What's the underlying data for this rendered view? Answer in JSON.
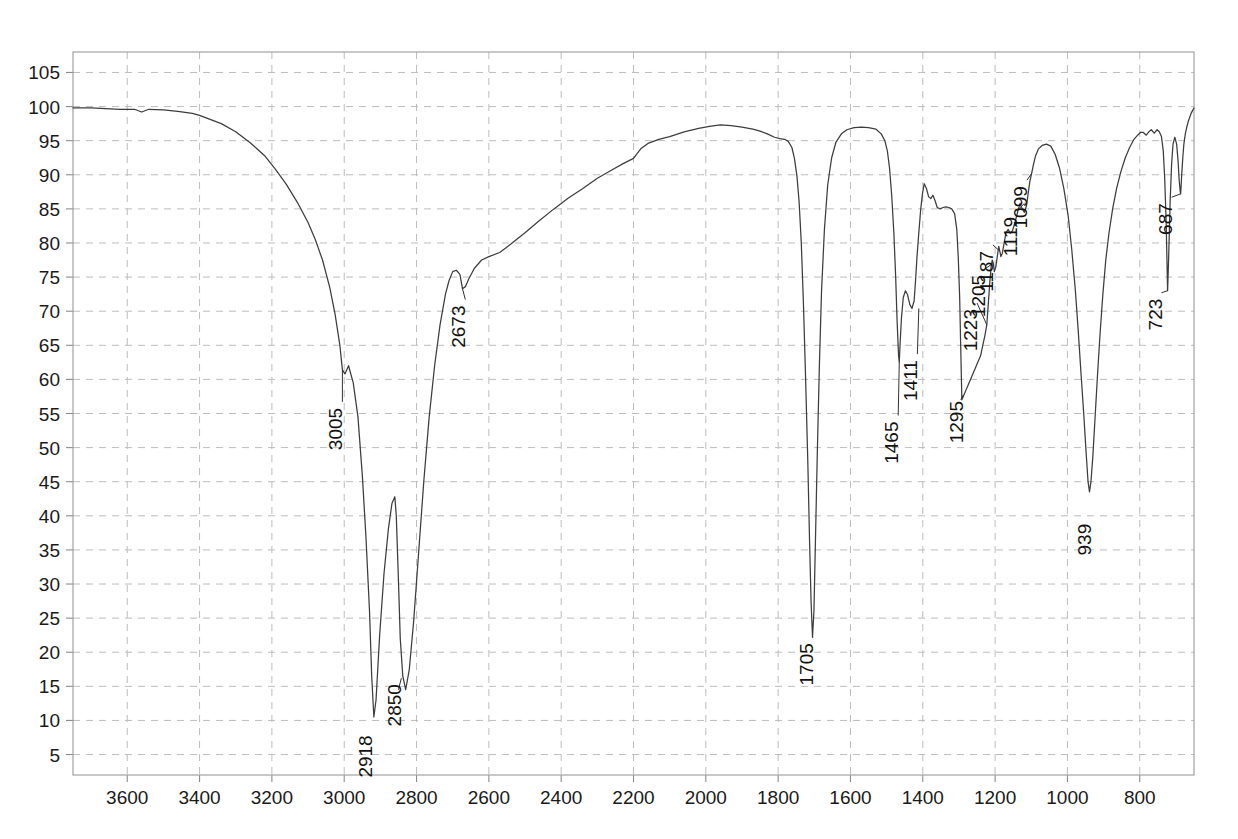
{
  "chart_data": {
    "type": "line",
    "title": "",
    "subtitle": "",
    "xlabel": "",
    "ylabel": "",
    "xlim": [
      3750,
      650
    ],
    "ylim": [
      2,
      108
    ],
    "x_axis_reversed": true,
    "grid": true,
    "legend": "none",
    "x_ticks": [
      3600,
      3400,
      3200,
      3000,
      2800,
      2600,
      2400,
      2200,
      2000,
      1800,
      1600,
      1400,
      1200,
      1000,
      800
    ],
    "y_ticks": [
      5,
      10,
      15,
      20,
      25,
      30,
      35,
      40,
      45,
      50,
      55,
      60,
      65,
      70,
      75,
      80,
      85,
      90,
      95,
      100,
      105
    ],
    "series": [
      {
        "name": "transmittance",
        "color": "#3d3d3d",
        "x": [
          3750,
          3730,
          3700,
          3660,
          3620,
          3580,
          3560,
          3540,
          3500,
          3460,
          3420,
          3400,
          3380,
          3340,
          3300,
          3260,
          3220,
          3190,
          3160,
          3130,
          3100,
          3080,
          3060,
          3040,
          3025,
          3012,
          3005,
          2998,
          2988,
          2975,
          2962,
          2950,
          2940,
          2930,
          2924,
          2918,
          2912,
          2902,
          2890,
          2878,
          2868,
          2860,
          2856,
          2850,
          2845,
          2838,
          2830,
          2820,
          2808,
          2795,
          2780,
          2765,
          2750,
          2735,
          2720,
          2710,
          2700,
          2690,
          2680,
          2673,
          2665,
          2655,
          2640,
          2620,
          2600,
          2570,
          2540,
          2500,
          2460,
          2420,
          2380,
          2340,
          2300,
          2260,
          2230,
          2200,
          2180,
          2160,
          2130,
          2100,
          2060,
          2020,
          1990,
          1960,
          1930,
          1900,
          1870,
          1850,
          1830,
          1810,
          1795,
          1782,
          1772,
          1762,
          1755,
          1748,
          1742,
          1736,
          1730,
          1724,
          1718,
          1713,
          1709,
          1705,
          1701,
          1697,
          1692,
          1686,
          1680,
          1672,
          1663,
          1652,
          1640,
          1625,
          1610,
          1590,
          1570,
          1550,
          1530,
          1515,
          1505,
          1498,
          1492,
          1486,
          1480,
          1475,
          1471,
          1467,
          1465,
          1463,
          1459,
          1454,
          1448,
          1442,
          1436,
          1430,
          1424,
          1420,
          1416,
          1411,
          1406,
          1401,
          1396,
          1390,
          1384,
          1378,
          1372,
          1366,
          1360,
          1352,
          1344,
          1336,
          1328,
          1320,
          1312,
          1306,
          1302,
          1298,
          1295,
          1292,
          1288,
          1284,
          1280,
          1276,
          1272,
          1268,
          1264,
          1260,
          1256,
          1252,
          1248,
          1244,
          1240,
          1236,
          1232,
          1228,
          1223,
          1219,
          1215,
          1211,
          1208,
          1205,
          1202,
          1198,
          1194,
          1190,
          1187,
          1184,
          1180,
          1175,
          1170,
          1164,
          1158,
          1152,
          1145,
          1138,
          1131,
          1125,
          1119,
          1113,
          1108,
          1104,
          1099,
          1094,
          1088,
          1080,
          1070,
          1058,
          1046,
          1034,
          1022,
          1010,
          998,
          988,
          978,
          970,
          962,
          955,
          948,
          943,
          939,
          935,
          930,
          924,
          917,
          910,
          902,
          894,
          885,
          875,
          864,
          852,
          840,
          828,
          816,
          806,
          798,
          790,
          782,
          775,
          768,
          760,
          752,
          746,
          740,
          735,
          731,
          727,
          723,
          720,
          716,
          712,
          708,
          703,
          698,
          694,
          691,
          688,
          687,
          686,
          684,
          681,
          678,
          674,
          670,
          666,
          662,
          658,
          654,
          650
        ],
        "y": [
          99.8,
          99.8,
          99.8,
          99.7,
          99.6,
          99.6,
          99.2,
          99.6,
          99.5,
          99.3,
          99.0,
          98.7,
          98.3,
          97.5,
          96.3,
          94.7,
          92.8,
          90.8,
          88.6,
          86.0,
          83.0,
          80.5,
          77.5,
          73.5,
          69.5,
          65.0,
          61.4,
          60.8,
          62.0,
          59.5,
          54.5,
          46.0,
          37.0,
          26.0,
          16.5,
          10.5,
          13.0,
          22.5,
          31.5,
          38.0,
          41.8,
          42.8,
          40.0,
          30.5,
          22.0,
          16.5,
          14.5,
          17.5,
          24.5,
          34.0,
          45.0,
          54.5,
          62.0,
          68.0,
          72.5,
          74.5,
          75.8,
          76.0,
          75.4,
          73.3,
          73.6,
          74.8,
          76.3,
          77.5,
          78.0,
          78.6,
          79.8,
          81.5,
          83.3,
          85.0,
          86.6,
          88.0,
          89.5,
          90.7,
          91.6,
          92.4,
          93.8,
          94.6,
          95.2,
          95.6,
          96.3,
          96.8,
          97.1,
          97.3,
          97.2,
          97.0,
          96.7,
          96.4,
          96.0,
          95.5,
          95.3,
          95.2,
          94.9,
          94.0,
          92.4,
          89.8,
          86.0,
          80.0,
          71.0,
          60.0,
          48.0,
          36.0,
          27.5,
          22.2,
          26.0,
          36.0,
          48.5,
          62.0,
          73.0,
          82.0,
          88.5,
          92.5,
          94.8,
          96.0,
          96.6,
          96.9,
          97.0,
          96.9,
          96.7,
          96.0,
          95.0,
          93.5,
          91.0,
          87.0,
          81.5,
          75.0,
          68.5,
          63.5,
          62.5,
          65.0,
          69.0,
          72.0,
          73.0,
          72.4,
          71.0,
          70.4,
          71.5,
          74.5,
          78.0,
          81.5,
          84.8,
          87.2,
          88.7,
          88.0,
          86.8,
          86.5,
          87.0,
          86.2,
          85.2,
          85.0,
          85.2,
          85.3,
          85.2,
          85.0,
          84.3,
          82.0,
          78.0,
          72.0,
          64.5,
          57.0,
          57.5,
          58.0,
          58.5,
          59.0,
          59.5,
          60.0,
          60.5,
          61.0,
          61.5,
          62.0,
          62.5,
          63.0,
          63.5,
          64.5,
          65.5,
          66.5,
          68.0,
          71.0,
          74.0,
          76.5,
          77.5,
          77.0,
          75.8,
          76.5,
          78.0,
          79.5,
          78.8,
          78.0,
          78.5,
          80.0,
          81.5,
          82.0,
          81.4,
          81.8,
          83.0,
          84.5,
          85.8,
          85.0,
          84.5,
          85.5,
          87.5,
          89.0,
          90.2,
          91.5,
          92.8,
          93.8,
          94.3,
          94.5,
          94.2,
          93.0,
          91.0,
          88.0,
          84.0,
          79.0,
          73.0,
          67.0,
          60.5,
          55.0,
          49.0,
          45.0,
          43.5,
          45.0,
          48.5,
          54.0,
          60.5,
          66.5,
          72.5,
          77.5,
          81.5,
          85.0,
          88.0,
          90.5,
          92.5,
          94.0,
          95.2,
          95.8,
          96.2,
          96.2,
          95.8,
          96.3,
          96.6,
          96.1,
          96.6,
          96.3,
          95.6,
          93.5,
          89.5,
          83.0,
          73.0,
          78.0,
          86.0,
          91.5,
          94.5,
          95.5,
          94.5,
          92.0,
          89.2,
          87.5,
          87.2,
          88.0,
          90.0,
          92.5,
          94.5,
          96.0,
          97.0,
          97.8,
          98.4,
          99.0,
          99.4,
          99.8
        ]
      }
    ],
    "annotations": [
      {
        "label": "3005",
        "x": 3005,
        "y": 61.4,
        "label_x": 3005,
        "label_y": 57.0,
        "rotation": -90,
        "leader": true
      },
      {
        "label": "2918",
        "x": 2918,
        "y": 10.5,
        "label_x": 2922,
        "label_y": 9.0,
        "rotation": -90,
        "leader": false
      },
      {
        "label": "2850",
        "x": 2850,
        "y": 14.5,
        "label_x": 2842,
        "label_y": 16.5,
        "rotation": -90,
        "leader": true
      },
      {
        "label": "2673",
        "x": 2673,
        "y": 73.3,
        "label_x": 2665,
        "label_y": 72.0,
        "rotation": -90,
        "leader": true
      },
      {
        "label": "1705",
        "x": 1705,
        "y": 22.2,
        "label_x": 1703,
        "label_y": 22.5,
        "rotation": -90,
        "leader": true
      },
      {
        "label": "1465",
        "x": 1465,
        "y": 62.5,
        "label_x": 1468,
        "label_y": 55.0,
        "rotation": -90,
        "leader": true
      },
      {
        "label": "1411",
        "x": 1411,
        "y": 70.4,
        "label_x": 1415,
        "label_y": 64.0,
        "rotation": -90,
        "leader": true
      },
      {
        "label": "1295",
        "x": 1295,
        "y": 57.0,
        "label_x": 1288,
        "label_y": 58.0,
        "rotation": -90,
        "leader": true
      },
      {
        "label": "1223",
        "x": 1223,
        "y": 68.0,
        "label_x": 1250,
        "label_y": 71.5,
        "rotation": -90,
        "leader": true
      },
      {
        "label": "1205",
        "x": 1205,
        "y": 77.0,
        "label_x": 1229,
        "label_y": 76.5,
        "rotation": -90,
        "leader": true
      },
      {
        "label": "1187",
        "x": 1187,
        "y": 78.8,
        "label_x": 1206,
        "label_y": 80.0,
        "rotation": -90,
        "leader": true
      },
      {
        "label": "1119",
        "x": 1119,
        "y": 85.8,
        "label_x": 1140,
        "label_y": 85.0,
        "rotation": -90,
        "leader": true
      },
      {
        "label": "1099",
        "x": 1099,
        "y": 90.2,
        "label_x": 1112,
        "label_y": 89.5,
        "rotation": -90,
        "leader": true
      },
      {
        "label": "939",
        "x": 939,
        "y": 43.5,
        "label_x": 936,
        "label_y": 40.0,
        "rotation": -90,
        "leader": false
      },
      {
        "label": "723",
        "x": 723,
        "y": 73.0,
        "label_x": 740,
        "label_y": 73.0,
        "rotation": -90,
        "leader": true
      },
      {
        "label": "687",
        "x": 687,
        "y": 87.2,
        "label_x": 712,
        "label_y": 87.0,
        "rotation": -90,
        "leader": true
      }
    ],
    "peaks": [
      {
        "wavenumber": 3005,
        "transmittance": 61.4
      },
      {
        "wavenumber": 2918,
        "transmittance": 10.5
      },
      {
        "wavenumber": 2850,
        "transmittance": 14.5
      },
      {
        "wavenumber": 2673,
        "transmittance": 73.3
      },
      {
        "wavenumber": 1705,
        "transmittance": 22.2
      },
      {
        "wavenumber": 1465,
        "transmittance": 62.5
      },
      {
        "wavenumber": 1411,
        "transmittance": 70.4
      },
      {
        "wavenumber": 1295,
        "transmittance": 57.0
      },
      {
        "wavenumber": 1223,
        "transmittance": 68.0
      },
      {
        "wavenumber": 1205,
        "transmittance": 77.0
      },
      {
        "wavenumber": 1187,
        "transmittance": 78.8
      },
      {
        "wavenumber": 1119,
        "transmittance": 85.8
      },
      {
        "wavenumber": 1099,
        "transmittance": 90.2
      },
      {
        "wavenumber": 939,
        "transmittance": 43.5
      },
      {
        "wavenumber": 723,
        "transmittance": 73.0
      },
      {
        "wavenumber": 687,
        "transmittance": 87.2
      }
    ]
  },
  "colors": {
    "trace": "#3d3d3d",
    "grid": "#bdbdbd",
    "frame": "#9a9a9a",
    "text": "#1a1a1a",
    "background": "#ffffff"
  }
}
